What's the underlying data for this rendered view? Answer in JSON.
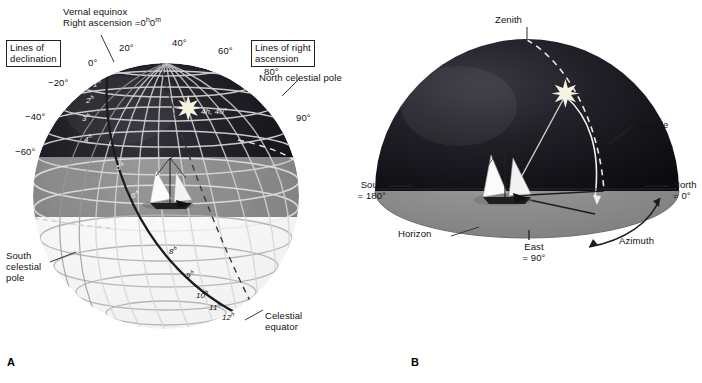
{
  "figure": {
    "panels": [
      {
        "letter": "A",
        "caption": "Equatorial coordinates"
      },
      {
        "letter": "B",
        "caption": "Horizon coordinates"
      }
    ]
  },
  "panel_a": {
    "letter": "A",
    "boxes": {
      "declination": "Lines of\ndeclination",
      "right_ascension": "Lines of right\nascension"
    },
    "callouts": {
      "vernal_equinox": "Vernal equinox\nRight ascension = 0h0m",
      "vernal_equinox_line1": "Vernal equinox",
      "vernal_equinox_line2_pre": "Right ascension =",
      "vernal_equinox_ra_h": "0",
      "vernal_equinox_ra_hsup": "h",
      "vernal_equinox_ra_m": "0",
      "vernal_equinox_ra_msup": "m",
      "north_celestial_pole": "North celestial pole",
      "south_celestial_pole": "South\ncelestial\npole",
      "celestial_equator": "Celestial\nequator",
      "star_coords": "4h, 40°"
    },
    "declination_labels": [
      {
        "text": "0°",
        "value": 0
      },
      {
        "text": "20°",
        "value": 20
      },
      {
        "text": "40°",
        "value": 40
      },
      {
        "text": "60°",
        "value": 60
      },
      {
        "text": "80°",
        "value": 80
      },
      {
        "text": "90°",
        "value": 90
      },
      {
        "text": "−20°",
        "value": -20
      },
      {
        "text": "−40°",
        "value": -40
      },
      {
        "text": "−60°",
        "value": -60
      }
    ],
    "right_ascension_labels": [
      {
        "h": "1",
        "sup": "h"
      },
      {
        "h": "2",
        "sup": "h"
      },
      {
        "h": "3",
        "sup": "h"
      },
      {
        "h": "4",
        "sup": "h"
      },
      {
        "h": "5",
        "sup": "h"
      },
      {
        "h": "6",
        "sup": "h"
      },
      {
        "h": "7",
        "sup": "h"
      },
      {
        "h": "8",
        "sup": "h"
      },
      {
        "h": "9",
        "sup": "h"
      },
      {
        "h": "10",
        "sup": "h"
      },
      {
        "h": "11",
        "sup": "h"
      },
      {
        "h": "12",
        "sup": "h"
      }
    ],
    "star": {
      "right_ascension": "4h",
      "declination": "40°"
    }
  },
  "panel_b": {
    "letter": "B",
    "callouts": {
      "zenith": "Zenith",
      "altitude": "Altitude",
      "azimuth": "Azimuth",
      "horizon": "Horizon",
      "north_line1": "North",
      "north_line2": "= 0°",
      "south_line1": "South",
      "south_line2": "= 180°",
      "east_line1": "East",
      "east_line2": "= 90°"
    },
    "cardinals": [
      {
        "name": "North",
        "azimuth": "0°"
      },
      {
        "name": "East",
        "azimuth": "90°"
      },
      {
        "name": "South",
        "azimuth": "180°"
      }
    ]
  },
  "colors": {
    "sky_dark": "#17161c",
    "ground": "#8a8a8a",
    "sphere_light": "#fbfbfb",
    "grid_light": "#dcdcdc",
    "grid_dark": "#8d8d8d",
    "equator": "#2a2a2a",
    "star": "#f6f3e4",
    "ink": "#111111"
  }
}
